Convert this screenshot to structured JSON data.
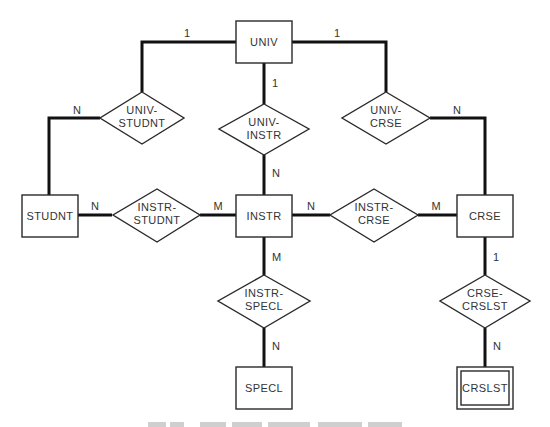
{
  "diagram": {
    "type": "entity-relationship",
    "entities": [
      {
        "id": "univ",
        "label": "UNIV",
        "weak": false
      },
      {
        "id": "studnt",
        "label": "STUDNT",
        "weak": false
      },
      {
        "id": "instr",
        "label": "INSTR",
        "weak": false
      },
      {
        "id": "crse",
        "label": "CRSE",
        "weak": false
      },
      {
        "id": "specl",
        "label": "SPECL",
        "weak": false
      },
      {
        "id": "crslst",
        "label": "CRSLST",
        "weak": true
      }
    ],
    "relationships": [
      {
        "id": "univ_studnt",
        "line1": "UNIV-",
        "line2": "STUDNT",
        "from": "UNIV",
        "to": "STUDNT",
        "from_card": "1",
        "to_card": "N"
      },
      {
        "id": "univ_instr",
        "line1": "UNIV-",
        "line2": "INSTR",
        "from": "UNIV",
        "to": "INSTR",
        "from_card": "1",
        "to_card": "N"
      },
      {
        "id": "univ_crse",
        "line1": "UNIV-",
        "line2": "CRSE",
        "from": "UNIV",
        "to": "CRSE",
        "from_card": "1",
        "to_card": "N"
      },
      {
        "id": "instr_studnt",
        "line1": "INSTR-",
        "line2": "STUDNT",
        "from": "INSTR",
        "to": "STUDNT",
        "from_card": "M",
        "to_card": "N"
      },
      {
        "id": "instr_crse",
        "line1": "INSTR-",
        "line2": "CRSE",
        "from": "INSTR",
        "to": "CRSE",
        "from_card": "N",
        "to_card": "M"
      },
      {
        "id": "instr_specl",
        "line1": "INSTR-",
        "line2": "SPECL",
        "from": "INSTR",
        "to": "SPECL",
        "from_card": "M",
        "to_card": "N"
      },
      {
        "id": "crse_crslst",
        "line1": "CRSE-",
        "line2": "CRSLST",
        "from": "CRSE",
        "to": "CRSLST",
        "from_card": "1",
        "to_card": "N"
      }
    ]
  }
}
